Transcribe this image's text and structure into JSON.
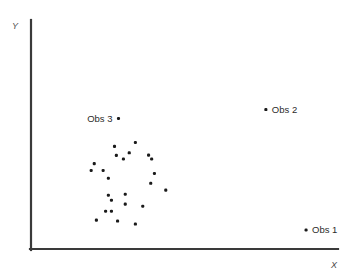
{
  "chart_data": {
    "type": "scatter",
    "title": "",
    "subtitle": "",
    "xlabel": "X",
    "ylabel": "Y",
    "xlim": [
      0,
      100
    ],
    "ylim": [
      0,
      100
    ],
    "grid": false,
    "legend": "none",
    "axis_ticks": "none",
    "marker_color": "#1a1a1a",
    "marker_size_px": 3.1,
    "axis_color": "#3a3a3a",
    "background_color": "#ffffff",
    "series": [
      {
        "name": "cluster",
        "points": [
          {
            "x": 20.6,
            "y": 37.3
          },
          {
            "x": 19.6,
            "y": 34.3
          },
          {
            "x": 23.5,
            "y": 34.3
          },
          {
            "x": 25.2,
            "y": 30.9
          },
          {
            "x": 27.2,
            "y": 44.8
          },
          {
            "x": 34.0,
            "y": 46.5
          },
          {
            "x": 38.3,
            "y": 41.0
          },
          {
            "x": 30.1,
            "y": 39.3
          },
          {
            "x": 32.0,
            "y": 42.0
          },
          {
            "x": 39.3,
            "y": 39.3
          },
          {
            "x": 27.8,
            "y": 40.9
          },
          {
            "x": 25.2,
            "y": 23.5
          },
          {
            "x": 26.2,
            "y": 21.3
          },
          {
            "x": 30.7,
            "y": 19.6
          },
          {
            "x": 24.3,
            "y": 16.5
          },
          {
            "x": 26.2,
            "y": 16.5
          },
          {
            "x": 21.3,
            "y": 12.6
          },
          {
            "x": 28.2,
            "y": 12.2
          },
          {
            "x": 36.4,
            "y": 18.7
          },
          {
            "x": 30.7,
            "y": 23.9
          },
          {
            "x": 39.0,
            "y": 28.7
          },
          {
            "x": 34.0,
            "y": 10.9
          },
          {
            "x": 40.2,
            "y": 33.0
          },
          {
            "x": 43.9,
            "y": 25.7
          }
        ]
      }
    ],
    "annotated_points": [
      {
        "label": "Obs 1",
        "x": 89.6,
        "y": 8.3,
        "label_side": "right"
      },
      {
        "label": "Obs 2",
        "x": 76.5,
        "y": 60.9,
        "label_side": "right"
      },
      {
        "label": "Obs 3",
        "x": 28.5,
        "y": 57.0,
        "label_side": "left"
      }
    ]
  },
  "axes": {
    "y_label": "Y",
    "x_label": "X"
  },
  "labels": {
    "obs1": "Obs 1",
    "obs2": "Obs 2",
    "obs3": "Obs 3"
  }
}
